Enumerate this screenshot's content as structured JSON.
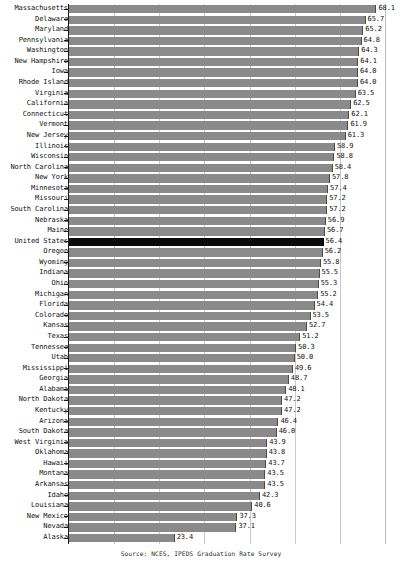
{
  "chart_data": {
    "type": "bar",
    "orientation": "horizontal",
    "title": "",
    "subtitle": "",
    "xlabel": "",
    "ylabel": "",
    "xlim": [
      0,
      70
    ],
    "grid": true,
    "gridlines": [
      10,
      20,
      30,
      40,
      50,
      60,
      70
    ],
    "legend": "none",
    "highlight_category": "United States",
    "categories": [
      "Massachusetts",
      "Delaware",
      "Maryland",
      "Pennsylvania",
      "Washington",
      "New Hampshire",
      "Iowa",
      "Rhode Island",
      "Virginia",
      "California",
      "Connecticut",
      "Vermont",
      "New Jersey",
      "Illinois",
      "Wisconsin",
      "North Carolina",
      "New York",
      "Minnesota",
      "Missouri",
      "South Carolina",
      "Nebraska",
      "Maine",
      "United States",
      "Oregon",
      "Wyoming",
      "Indiana",
      "Ohio",
      "Michigan",
      "Florida",
      "Colorado",
      "Kansas",
      "Texas",
      "Tennessee",
      "Utah",
      "Mississippi",
      "Georgia",
      "Alabama",
      "North Dakota",
      "Kentucky",
      "Arizona",
      "South Dakota",
      "West Virginia",
      "Oklahoma",
      "Hawaii",
      "Montana",
      "Arkansas",
      "Idaho",
      "Louisiana",
      "New Mexico",
      "Nevada",
      "Alaska"
    ],
    "values": [
      68.1,
      65.7,
      65.2,
      64.8,
      64.3,
      64.1,
      64.0,
      64.0,
      63.5,
      62.5,
      62.1,
      61.9,
      61.3,
      58.9,
      58.8,
      58.4,
      57.8,
      57.4,
      57.2,
      57.2,
      56.9,
      56.7,
      56.4,
      56.2,
      55.8,
      55.5,
      55.3,
      55.2,
      54.4,
      53.5,
      52.7,
      51.2,
      50.3,
      50.0,
      49.6,
      48.7,
      48.1,
      47.2,
      47.2,
      46.4,
      46.0,
      43.9,
      43.8,
      43.7,
      43.5,
      43.5,
      42.3,
      40.6,
      37.3,
      37.1,
      23.4
    ],
    "value_labels": [
      "68.1",
      "65.7",
      "65.2",
      "64.8",
      "64.3",
      "64.1",
      "64.0",
      "64.0",
      "63.5",
      "62.5",
      "62.1",
      "61.9",
      "61.3",
      "58.9",
      "58.8",
      "58.4",
      "57.8",
      "57.4",
      "57.2",
      "57.2",
      "56.9",
      "56.7",
      "56.4",
      "56.2",
      "55.8",
      "55.5",
      "55.3",
      "55.2",
      "54.4",
      "53.5",
      "52.7",
      "51.2",
      "50.3",
      "50.0",
      "49.6",
      "48.7",
      "48.1",
      "47.2",
      "47.2",
      "46.4",
      "46.0",
      "43.9",
      "43.8",
      "43.7",
      "43.5",
      "43.5",
      "42.3",
      "40.6",
      "37.3",
      "37.1",
      "23.4"
    ],
    "colors": {
      "bar": "#8a8a8a",
      "bar_highlight": "#0a0a0a",
      "axis": "#1a1a1a",
      "grid": "#c9c9c9",
      "text": "#111111",
      "background": "#ffffff"
    }
  },
  "footer": {
    "source": "Source: NCES, IPEDS Graduation Rate Survey"
  }
}
